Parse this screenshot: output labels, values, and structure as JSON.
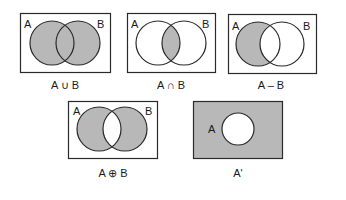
{
  "colors": {
    "shade": "#b8b8b8",
    "stroke": "#2a2a2a",
    "background": "#ffffff"
  },
  "diagrams": [
    {
      "id": "union",
      "set_a": "A",
      "set_b": "B",
      "caption": "A ∪ B",
      "shaded": "A or B"
    },
    {
      "id": "intersection",
      "set_a": "A",
      "set_b": "B",
      "caption": "A ∩ B",
      "shaded": "A and B"
    },
    {
      "id": "difference",
      "set_a": "A",
      "set_b": "B",
      "caption": "A – B",
      "shaded": "A only"
    },
    {
      "id": "symmetric-difference",
      "set_a": "A",
      "set_b": "B",
      "caption": "A ⊕ B",
      "shaded": "A xor B"
    },
    {
      "id": "complement",
      "set_a": "A",
      "caption": "A'",
      "shaded": "outside A"
    }
  ]
}
